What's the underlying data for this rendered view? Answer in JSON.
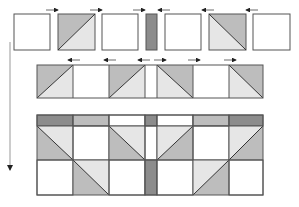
{
  "diagram": {
    "colors": {
      "dark": "#8c8c8c",
      "medium": "#bdbdbd",
      "light": "#e6e6e6",
      "white": "#ffffff",
      "stroke": "#555555",
      "arrow": "#222222"
    },
    "row1_pieces": [
      "square",
      "hst",
      "square",
      "strip",
      "square",
      "hst",
      "square"
    ],
    "row1_arrows": [
      "right",
      "right",
      "right",
      "left",
      "left",
      "left"
    ],
    "row2_units": [
      "hst",
      "square",
      "hst",
      "strip",
      "hst",
      "square",
      "hst"
    ],
    "row2_arrows": [
      "left",
      "left",
      "left",
      "right",
      "right",
      "right"
    ],
    "block_top_band": [
      "dark",
      "medium",
      "white",
      "dark",
      "white",
      "medium",
      "dark"
    ],
    "block_row_a": [
      "hst",
      "square",
      "hst",
      "strip",
      "hst",
      "square",
      "hst"
    ],
    "block_row_b": [
      "square",
      "hst",
      "square",
      "dark-strip",
      "square",
      "hst",
      "square"
    ],
    "left_arrow": "down"
  }
}
